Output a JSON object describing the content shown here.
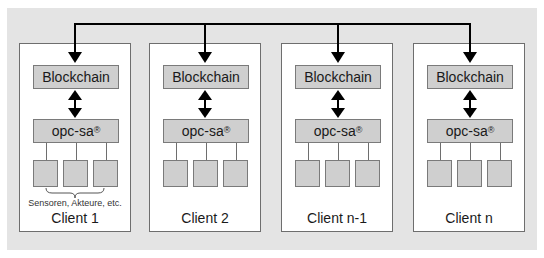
{
  "diagram": {
    "bus_line": "top connection bus",
    "clients": [
      {
        "name": "Client 1",
        "blockchain_label": "Blockchain",
        "middleware_label": "opc-sa",
        "middleware_mark": "®",
        "devices_note": "Sensoren, Akteure, etc.",
        "device_count": 3
      },
      {
        "name": "Client 2",
        "blockchain_label": "Blockchain",
        "middleware_label": "opc-sa",
        "middleware_mark": "®",
        "device_count": 3
      },
      {
        "name": "Client n-1",
        "blockchain_label": "Blockchain",
        "middleware_label": "opc-sa",
        "middleware_mark": "®",
        "device_count": 3
      },
      {
        "name": "Client n",
        "blockchain_label": "Blockchain",
        "middleware_label": "opc-sa",
        "middleware_mark": "®",
        "device_count": 3
      }
    ],
    "colors": {
      "background": "#e4e4e4",
      "client_fill": "#ffffff",
      "box_fill": "#cfcfcf",
      "line": "#000000"
    }
  }
}
